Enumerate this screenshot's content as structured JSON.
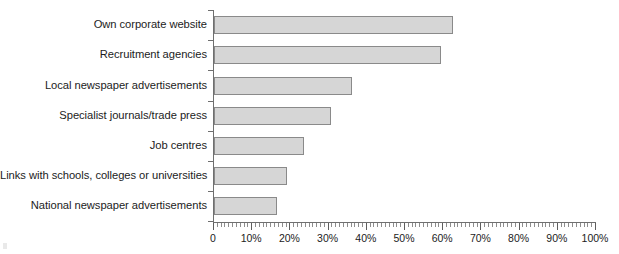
{
  "chart_data": {
    "type": "bar",
    "orientation": "horizontal",
    "title": "",
    "subtitle": "",
    "xlabel": "",
    "ylabel": "",
    "xlim": [
      0,
      100
    ],
    "grid": false,
    "legend": null,
    "axis_unit": "%",
    "x_tick_labels": [
      "0",
      "10%",
      "20%",
      "30%",
      "40%",
      "50%",
      "60%",
      "70%",
      "80%",
      "90%",
      "100%"
    ],
    "x_tick_values": [
      0,
      10,
      20,
      30,
      40,
      50,
      60,
      70,
      80,
      90,
      100
    ],
    "minor_tick_step": 1,
    "categories": [
      "Own corporate website",
      "Recruitment agencies",
      "Local newspaper advertisements",
      "Specialist journals/trade press",
      "Job centres",
      "Links with schools, colleges or universities",
      "National newspaper advertisements"
    ],
    "values": [
      62.5,
      59.5,
      36,
      30.5,
      23.5,
      19,
      16.5
    ],
    "bar_fill_color": "#d6d6d6",
    "bar_border_color": "#8a8a8a",
    "axis_color": "#6f6f6f",
    "text_color": "#1c1c1c"
  }
}
